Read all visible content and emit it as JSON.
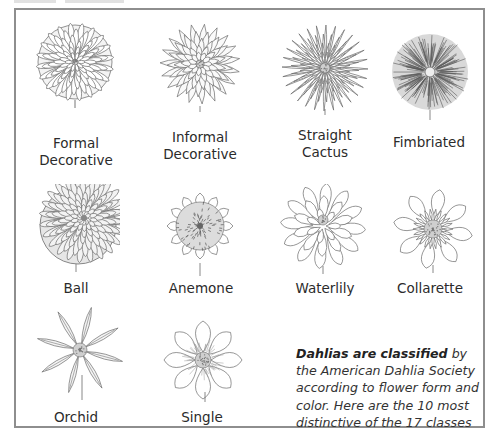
{
  "figure": {
    "border_color": "#8e8e8e",
    "ink_color": "#555555",
    "classes": [
      {
        "id": "formal-decorative",
        "label_lines": [
          "Formal",
          "Decorative"
        ],
        "style": "layered-rounded"
      },
      {
        "id": "informal-decorative",
        "label_lines": [
          "Informal",
          "Decorative"
        ],
        "style": "pointed-layered"
      },
      {
        "id": "straight-cactus",
        "label_lines": [
          "Straight",
          "Cactus"
        ],
        "style": "spiky-rays"
      },
      {
        "id": "fimbriated",
        "label_lines": [
          "Fimbriated"
        ],
        "style": "dense-fringe"
      },
      {
        "id": "ball",
        "label_lines": [
          "Ball"
        ],
        "style": "ball-scales"
      },
      {
        "id": "anemone",
        "label_lines": [
          "Anemone"
        ],
        "style": "cushion-center"
      },
      {
        "id": "waterlily",
        "label_lines": [
          "Waterlily"
        ],
        "style": "open-layered"
      },
      {
        "id": "collarette",
        "label_lines": [
          "Collarette"
        ],
        "style": "collar"
      },
      {
        "id": "orchid",
        "label_lines": [
          "Orchid"
        ],
        "style": "star-rolled"
      },
      {
        "id": "single",
        "label_lines": [
          "Single"
        ],
        "style": "single-petals"
      }
    ],
    "note": {
      "bold_lead": "Dahlias are classified",
      "rest": " by the American Dahlia Society according to flower form and color. Here are the 10 most distinctive of the 17 classes the Society recognizes."
    }
  }
}
